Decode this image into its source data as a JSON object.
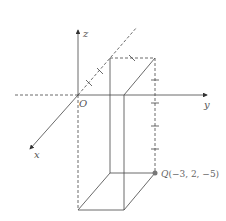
{
  "diagram": {
    "type": "3d-coordinate-box",
    "axes": {
      "x_label": "x",
      "y_label": "y",
      "z_label": "z",
      "origin_label": "O"
    },
    "point": {
      "name": "Q",
      "coords": "(−3, 2, −5)",
      "x": -3,
      "y": 2,
      "z": -5
    },
    "colors": {
      "line": "#444444",
      "point": "#777777"
    }
  }
}
